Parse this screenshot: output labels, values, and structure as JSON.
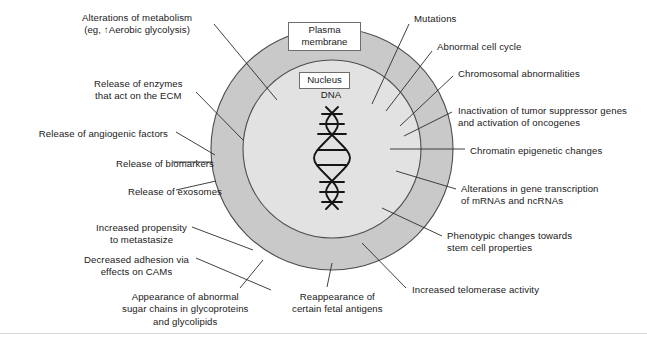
{
  "figure": {
    "colors": {
      "cytoplasm_fill": "#c9c9c9",
      "nucleus_fill": "#e2e2e2",
      "outline": "#4d4d4d",
      "leader_line": "#2b2b2b",
      "text": "#1a1a1a",
      "box_border": "#6d6d6d",
      "box_fill": "#ffffff",
      "background": "#ffffff"
    },
    "geometry": {
      "cell_center_x": 332,
      "cell_center_y": 149,
      "cell_radius": 121,
      "nucleus_radius": 89
    }
  },
  "internal_labels": {
    "plasma_membrane": "Plasma\nmembrane",
    "nucleus": "Nucleus",
    "dna": "DNA"
  },
  "callouts": [
    {
      "id": "alterations-of-metabolism",
      "text": "Alterations of metabolism\n(eg, ↑Aerobic glycolysis)",
      "side": "left",
      "align": "center",
      "text_x": 82,
      "text_y": 12,
      "line": {
        "x1": 214,
        "y1": 24,
        "x2": 277,
        "y2": 100
      }
    },
    {
      "id": "release-of-enzymes-ecm",
      "text": "Release of enzymes\nthat act on the ECM",
      "side": "left",
      "align": "center",
      "text_x": 94,
      "text_y": 78,
      "line": {
        "x1": 196,
        "y1": 92,
        "x2": 243,
        "y2": 140
      }
    },
    {
      "id": "release-of-angiogenic-factors",
      "text": "Release of angiogenic factors",
      "side": "left",
      "align": "right",
      "text_x": 18,
      "text_y": 128,
      "line": {
        "x1": 176,
        "y1": 132,
        "x2": 215,
        "y2": 155
      }
    },
    {
      "id": "release-of-biomarkers",
      "text": "Release of biomarkers",
      "side": "left",
      "align": "right",
      "text_x": 64,
      "text_y": 158,
      "line": {
        "x1": 172,
        "y1": 162,
        "x2": 212,
        "y2": 162
      }
    },
    {
      "id": "release-of-exosomes",
      "text": "Release of exosomes",
      "side": "left",
      "align": "right",
      "text_x": 72,
      "text_y": 186,
      "line": {
        "x1": 176,
        "y1": 190,
        "x2": 216,
        "y2": 181
      }
    },
    {
      "id": "increased-propensity-to-metastasize",
      "text": "Increased propensity\nto metastasize",
      "side": "left",
      "align": "center",
      "text_x": 96,
      "text_y": 222,
      "line": {
        "x1": 192,
        "y1": 227,
        "x2": 253,
        "y2": 250
      }
    },
    {
      "id": "decreased-adhesion-cams",
      "text": "Decreased adhesion via\neffects on CAMs",
      "side": "left",
      "align": "center",
      "text_x": 84,
      "text_y": 254,
      "line": {
        "x1": 196,
        "y1": 258,
        "x2": 271,
        "y2": 290
      }
    },
    {
      "id": "abnormal-sugar-chains",
      "text": "Appearance of abnormal\nsugar chains in glycoproteins\nand glycolipids",
      "side": "bottom",
      "align": "center",
      "text_x": 122,
      "text_y": 291,
      "line": {
        "x1": 240,
        "y1": 288,
        "x2": 263,
        "y2": 260
      }
    },
    {
      "id": "reappearance-of-fetal-antigens",
      "text": "Reappearance of\ncertain fetal antigens",
      "side": "bottom",
      "align": "center",
      "text_x": 292,
      "text_y": 291,
      "line": {
        "x1": 327,
        "y1": 287,
        "x2": 332,
        "y2": 263
      }
    },
    {
      "id": "mutations",
      "text": "Mutations",
      "side": "right",
      "align": "left",
      "text_x": 414,
      "text_y": 13,
      "line": {
        "x1": 409,
        "y1": 24,
        "x2": 372,
        "y2": 104
      }
    },
    {
      "id": "abnormal-cell-cycle",
      "text": "Abnormal cell cycle",
      "side": "right",
      "align": "left",
      "text_x": 437,
      "text_y": 41,
      "line": {
        "x1": 432,
        "y1": 51,
        "x2": 386,
        "y2": 111
      }
    },
    {
      "id": "chromosomal-abnormalities",
      "text": "Chromosomal abnormalities",
      "side": "right",
      "align": "left",
      "text_x": 458,
      "text_y": 68,
      "line": {
        "x1": 453,
        "y1": 76,
        "x2": 400,
        "y2": 126
      }
    },
    {
      "id": "inactivation-tumor-suppressor-genes",
      "text": "Inactivation of tumor suppressor genes\nand activation of oncogenes",
      "side": "right",
      "align": "left",
      "text_x": 458,
      "text_y": 105,
      "line": {
        "x1": 452,
        "y1": 112,
        "x2": 404,
        "y2": 136
      }
    },
    {
      "id": "chromatin-epigenetic-changes",
      "text": "Chromatin epigenetic changes",
      "side": "right",
      "align": "left",
      "text_x": 470,
      "text_y": 145,
      "line": {
        "x1": 465,
        "y1": 149,
        "x2": 390,
        "y2": 149
      }
    },
    {
      "id": "alterations-gene-transcription",
      "text": "Alterations in gene transcription\nof mRNAs and ncRNAs",
      "side": "right",
      "align": "left",
      "text_x": 461,
      "text_y": 183,
      "line": {
        "x1": 456,
        "y1": 189,
        "x2": 396,
        "y2": 171
      }
    },
    {
      "id": "phenotypic-changes-stem-cell",
      "text": "Phenotypic changes towards\nstem cell properties",
      "side": "right",
      "align": "left",
      "text_x": 447,
      "text_y": 230,
      "line": {
        "x1": 442,
        "y1": 236,
        "x2": 382,
        "y2": 208
      }
    },
    {
      "id": "increased-telomerase-activity",
      "text": "Increased telomerase activity",
      "side": "right",
      "align": "left",
      "text_x": 412,
      "text_y": 284,
      "line": {
        "x1": 406,
        "y1": 288,
        "x2": 362,
        "y2": 243
      }
    }
  ]
}
